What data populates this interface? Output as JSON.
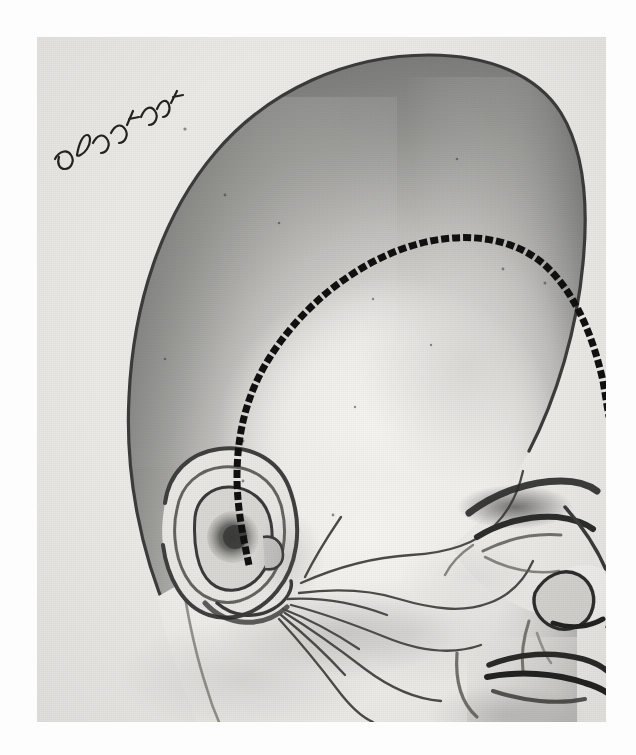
{
  "figure": {
    "kind": "medical-illustration",
    "medium": "halftone print, grayscale pen-and-wash drawing",
    "title": "Infant head in right lateral profile with marked scalp incision",
    "subject": "Infant head and neck, lateral (profile) view facing right",
    "alt_text": "Grayscale surgical illustration of an infant's head seen in profile facing right. A heavy black dashed line marks a curved scalp incision that arcs from high on the frontal region backward over the parietal vault and then descends in front of and below the ear. Fine curving lines on the cheek and preauricular region depict branches of the facial nerve.",
    "signature": {
      "present": true,
      "legible": false,
      "description": "artist's cursive monogram initials on the upper-left cranial outline"
    }
  },
  "colors": {
    "page_background": "#fdfdfd",
    "plate_background": "#e9e9e7",
    "paper_light": "#f2f1ee",
    "skin_light": "#ececea",
    "skin_mid": "#c9c8c5",
    "skull_shadow": "#8f8f8d",
    "skull_deep_shadow": "#6e6e6c",
    "outline": "#3a3a39",
    "ink_black": "#141414",
    "nerve_line": "#4a4a48",
    "incision_dash": "#111111"
  },
  "plate": {
    "x": 37,
    "y": 37,
    "width": 569,
    "height": 685
  },
  "annotations": {
    "incision_line": {
      "label": "scalp incision line",
      "style": "dashed",
      "color": "#111111",
      "dash_length_px": 8,
      "gap_length_px": 3,
      "stroke_width_px": 7,
      "description": "Coronal / preauricular scalp flap incision marked with heavy dashes",
      "path": "M 212 528 C 206 500 200 470 200 440 C 200 396 210 356 233 320 C 262 274 310 232 365 212 C 420 192 478 198 512 232 C 540 260 556 300 566 344 L 572 380"
    },
    "head_outline": {
      "label": "cranial and facial contour",
      "color": "#3a3a39",
      "description": "Large dolichocephalic infant cranium, forehead, nose, lips and chin in profile"
    },
    "facial_nerve_lines": {
      "label": "facial nerve branches",
      "color": "#4a4a48",
      "count": 9,
      "description": "Fine curving lines fanning forward from the preauricular region across the cheek toward the eye, nose and mouth"
    },
    "ear": {
      "label": "external ear (auricle)",
      "description": "Left auricle with helix, antihelix, concha, tragus and lobule rendered in shaded detail"
    },
    "eye": {
      "label": "closed eye",
      "description": "Eyelid closed, lashes and brow shaded"
    },
    "nose": {
      "label": "nose",
      "description": "Upturned infant nose in profile with nostril"
    },
    "mouth": {
      "label": "mouth and lips",
      "description": "Upper and lower lip with philtrum shading"
    },
    "neck": {
      "label": "neck",
      "description": "Neck and upper shoulder contour at lower left"
    }
  }
}
